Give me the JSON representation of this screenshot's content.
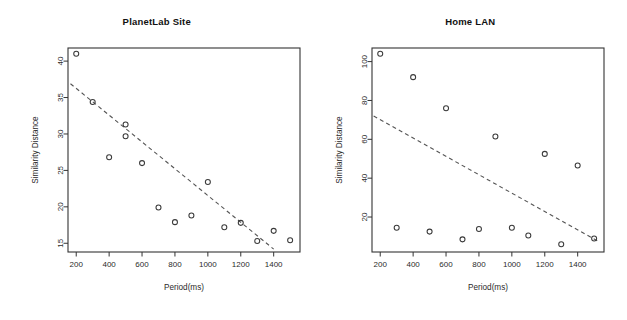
{
  "figure": {
    "background": "#ffffff",
    "marker_color": "#3a3a3a",
    "line_color": "#555555",
    "axis_color": "#333333"
  },
  "chart_data": [
    {
      "type": "scatter",
      "title": "PlanetLab Site",
      "xlabel": "Period(ms)",
      "ylabel": "Similarity Distance",
      "xlim": [
        150,
        1560
      ],
      "ylim": [
        13.8,
        41.8
      ],
      "xticks": [
        200,
        400,
        600,
        800,
        1000,
        1200,
        1400
      ],
      "yticks": [
        15,
        20,
        25,
        30,
        35,
        40
      ],
      "grid": false,
      "legend": null,
      "x": [
        200,
        300,
        400,
        500,
        500,
        600,
        700,
        800,
        900,
        1000,
        1100,
        1200,
        1300,
        1400,
        1500
      ],
      "y": [
        41.0,
        34.4,
        26.8,
        29.7,
        31.3,
        26.0,
        19.9,
        17.9,
        18.8,
        23.4,
        17.2,
        17.8,
        15.3,
        16.7,
        15.4
      ],
      "trend": {
        "type": "dashed-linear-fit",
        "x": [
          165,
          1400
        ],
        "y": [
          36.9,
          14.2
        ]
      }
    },
    {
      "type": "scatter",
      "title": "Home LAN",
      "xlabel": "Period(ms)",
      "ylabel": "Similarity Distance",
      "xlim": [
        150,
        1560
      ],
      "ylim": [
        2,
        107
      ],
      "xticks": [
        200,
        400,
        600,
        800,
        1000,
        1200,
        1400
      ],
      "yticks": [
        20,
        40,
        60,
        80,
        100
      ],
      "grid": false,
      "legend": null,
      "x": [
        200,
        300,
        400,
        500,
        600,
        700,
        800,
        900,
        1000,
        1100,
        1200,
        1300,
        1400,
        1500
      ],
      "y": [
        104.0,
        14.5,
        92.0,
        12.5,
        76.0,
        8.5,
        13.8,
        61.5,
        14.5,
        10.5,
        52.5,
        6.0,
        46.5,
        9.0
      ],
      "trend": {
        "type": "dashed-linear-fit",
        "x": [
          160,
          1525
        ],
        "y": [
          72.0,
          7.5
        ]
      }
    }
  ]
}
